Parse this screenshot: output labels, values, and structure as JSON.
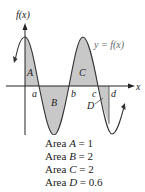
{
  "figure": {
    "y_axis_label": "f(x)",
    "x_axis_label": "x",
    "curve_label": "y = f(x)",
    "region_labels": [
      "A",
      "B",
      "C",
      "D"
    ],
    "point_labels": [
      "a",
      "b",
      "c",
      "d"
    ],
    "colors": {
      "curve": "#333333",
      "shade": "#c8c8c8",
      "axis": "#222222"
    }
  },
  "areas": [
    {
      "prefix": "Area ",
      "region": "A",
      "eq": " = 1"
    },
    {
      "prefix": "Area ",
      "region": "B",
      "eq": " = 2"
    },
    {
      "prefix": "Area ",
      "region": "C",
      "eq": " = 2"
    },
    {
      "prefix": "Area ",
      "region": "D",
      "eq": " = 0.6"
    }
  ]
}
